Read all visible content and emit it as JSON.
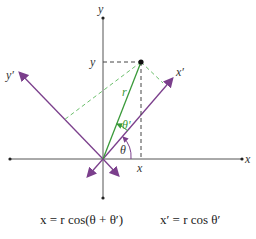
{
  "diagram": {
    "labels": {
      "y_axis_top": "y",
      "y_coord": "y",
      "x_axis_right": "x",
      "x_coord": "x",
      "x_prime": "x′",
      "y_prime": "y′",
      "r": "r",
      "theta": "θ",
      "theta_prime": "θ′"
    },
    "colors": {
      "axes": "#555555",
      "rotated_axes": "#7b3f8c",
      "radius": "#3a9a3a",
      "dashed_projection": "#444444",
      "dashed_rotated_projection": "#6cbf6c"
    }
  },
  "equations": {
    "left": "x = r cos(θ + θ′)",
    "right": "x′ = r cos θ′"
  }
}
